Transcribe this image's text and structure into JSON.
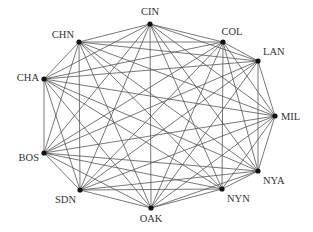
{
  "diagram": {
    "type": "network-graph",
    "node_color": "#111111",
    "edge_color": "#555555",
    "nodes": [
      {
        "id": "CIN",
        "label": "CIN",
        "x": 150,
        "y": 24,
        "lx": 150,
        "ly": 15,
        "anchor": "middle"
      },
      {
        "id": "COL",
        "label": "COL",
        "x": 223,
        "y": 42,
        "lx": 232,
        "ly": 35,
        "anchor": "middle"
      },
      {
        "id": "LAN",
        "label": "LAN",
        "x": 258,
        "y": 61,
        "lx": 263,
        "ly": 55,
        "anchor": "start"
      },
      {
        "id": "MIL",
        "label": "MIL",
        "x": 275,
        "y": 116,
        "lx": 281,
        "ly": 120,
        "anchor": "start"
      },
      {
        "id": "NYA",
        "label": "NYA",
        "x": 258,
        "y": 171,
        "lx": 263,
        "ly": 184,
        "anchor": "start"
      },
      {
        "id": "NYN",
        "label": "NYN",
        "x": 222,
        "y": 189,
        "lx": 227,
        "ly": 202,
        "anchor": "start"
      },
      {
        "id": "OAK",
        "label": "OAK",
        "x": 151,
        "y": 208,
        "lx": 151,
        "ly": 222,
        "anchor": "middle"
      },
      {
        "id": "SDN",
        "label": "SDN",
        "x": 80,
        "y": 190,
        "lx": 76,
        "ly": 203,
        "anchor": "end"
      },
      {
        "id": "BOS",
        "label": "BOS",
        "x": 44,
        "y": 153,
        "lx": 39,
        "ly": 161,
        "anchor": "end"
      },
      {
        "id": "CHA",
        "label": "CHA",
        "x": 44,
        "y": 79,
        "lx": 39,
        "ly": 81,
        "anchor": "end"
      },
      {
        "id": "CHN",
        "label": "CHN",
        "x": 79,
        "y": 42,
        "lx": 74,
        "ly": 38,
        "anchor": "end"
      }
    ],
    "edges": [
      [
        "CIN",
        "CHN"
      ],
      [
        "CIN",
        "COL"
      ],
      [
        "CIN",
        "LAN"
      ],
      [
        "CIN",
        "OAK"
      ],
      [
        "CIN",
        "NYN"
      ],
      [
        "CIN",
        "NYA"
      ],
      [
        "CIN",
        "SDN"
      ],
      [
        "CIN",
        "BOS"
      ],
      [
        "CIN",
        "MIL"
      ],
      [
        "CIN",
        "CHA"
      ],
      [
        "CHN",
        "COL"
      ],
      [
        "CHN",
        "LAN"
      ],
      [
        "CHN",
        "MIL"
      ],
      [
        "CHN",
        "NYA"
      ],
      [
        "CHN",
        "NYN"
      ],
      [
        "CHN",
        "SDN"
      ],
      [
        "CHN",
        "OAK"
      ],
      [
        "CHN",
        "CHA"
      ],
      [
        "COL",
        "LAN"
      ],
      [
        "COL",
        "NYN"
      ],
      [
        "COL",
        "CHA"
      ],
      [
        "COL",
        "BOS"
      ],
      [
        "COL",
        "SDN"
      ],
      [
        "COL",
        "OAK"
      ],
      [
        "COL",
        "NYA"
      ],
      [
        "COL",
        "MIL"
      ],
      [
        "LAN",
        "MIL"
      ],
      [
        "LAN",
        "NYA"
      ],
      [
        "LAN",
        "CHA"
      ],
      [
        "LAN",
        "BOS"
      ],
      [
        "LAN",
        "SDN"
      ],
      [
        "LAN",
        "OAK"
      ],
      [
        "MIL",
        "CHA"
      ],
      [
        "MIL",
        "BOS"
      ],
      [
        "MIL",
        "SDN"
      ],
      [
        "MIL",
        "OAK"
      ],
      [
        "MIL",
        "NYA"
      ],
      [
        "MIL",
        "NYN"
      ],
      [
        "NYA",
        "NYN"
      ],
      [
        "NYA",
        "OAK"
      ],
      [
        "NYA",
        "SDN"
      ],
      [
        "NYA",
        "BOS"
      ],
      [
        "NYA",
        "CHA"
      ],
      [
        "NYN",
        "OAK"
      ],
      [
        "NYN",
        "SDN"
      ],
      [
        "NYN",
        "BOS"
      ],
      [
        "NYN",
        "CHA"
      ],
      [
        "OAK",
        "SDN"
      ],
      [
        "OAK",
        "BOS"
      ],
      [
        "OAK",
        "CHA"
      ],
      [
        "SDN",
        "BOS"
      ],
      [
        "SDN",
        "CHA"
      ],
      [
        "BOS",
        "CHA"
      ],
      [
        "BOS",
        "CHN"
      ]
    ]
  }
}
